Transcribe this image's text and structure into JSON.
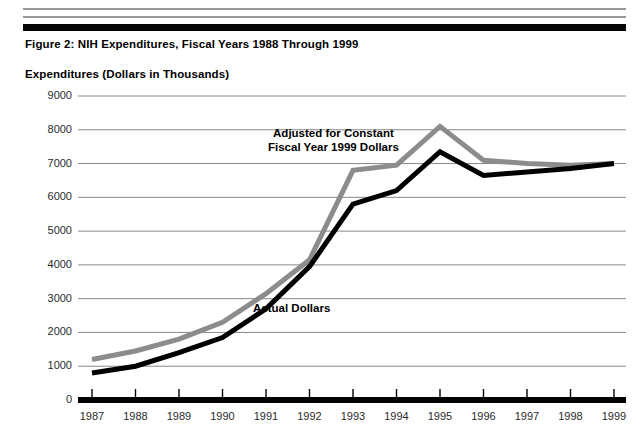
{
  "figure": {
    "title": "Figure 2:  NIH Expenditures, Fiscal Years 1988 Through 1999",
    "axis_title": "Expenditures (Dollars in Thousands)"
  },
  "annotations": {
    "adjusted_line1": "Adjusted for Constant",
    "adjusted_line2": "Fiscal Year 1999 Dollars",
    "actual": "Actual Dollars"
  },
  "colors": {
    "actual_line": "#000000",
    "adjusted_line": "#8c8c8c",
    "gridline": "#888888",
    "axis": "#000000",
    "rule_thin": "#9a9a9a",
    "rule_thick": "#050505"
  },
  "chart_data": {
    "type": "line",
    "title": "Figure 2:  NIH Expenditures, Fiscal Years 1988 Through 1999",
    "xlabel": "",
    "ylabel": "Expenditures (Dollars in Thousands)",
    "ylim": [
      0,
      9000
    ],
    "ytick_values": [
      0,
      1000,
      2000,
      3000,
      4000,
      5000,
      6000,
      7000,
      8000,
      9000
    ],
    "ytick_labels": [
      "0",
      "1000",
      "2000",
      "3000",
      "4000",
      "5000",
      "6000",
      "7000",
      "8000",
      "9000"
    ],
    "grid": true,
    "grid_axis": "y",
    "legend": "inline-annotations",
    "categories": [
      1987,
      1988,
      1989,
      1990,
      1991,
      1992,
      1993,
      1994,
      1995,
      1996,
      1997,
      1998,
      1999
    ],
    "xtick_labels": [
      "1987",
      "1988",
      "1989",
      "1990",
      "1991",
      "1992",
      "1993",
      "1994",
      "1995",
      "1996",
      "1997",
      "1998",
      "1999"
    ],
    "series": [
      {
        "name": "Adjusted for Constant Fiscal Year 1999 Dollars",
        "color": "#8c8c8c",
        "values": [
          1200,
          1450,
          1800,
          2300,
          3150,
          4150,
          6800,
          6950,
          8100,
          7100,
          7000,
          6950,
          7000
        ]
      },
      {
        "name": "Actual Dollars",
        "color": "#000000",
        "values": [
          800,
          1000,
          1400,
          1850,
          2700,
          3950,
          5800,
          6200,
          7350,
          6650,
          6750,
          6850,
          7000
        ]
      }
    ]
  }
}
